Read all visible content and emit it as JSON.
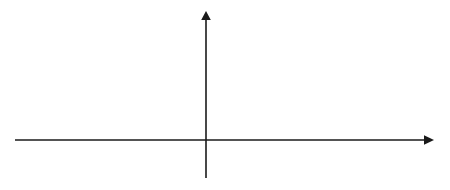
{
  "figure": {
    "background_color": "#ffffff",
    "line_color": "#3a3a3a",
    "axis_color": "#1a1a1a",
    "dash_color": "#111111"
  },
  "axes": {
    "y_axis_label": "a(τ)",
    "x_axis_label": "τ",
    "origin_px": {
      "x": 206,
      "y": 140
    },
    "x_axis_start_px": 15,
    "x_axis_end_px": 432,
    "y_axis_top_px": 12,
    "y_axis_bottom_px": 178
  },
  "ticks": [
    {
      "label": "T",
      "x_px": 264,
      "value": 1
    },
    {
      "label": "2T",
      "x_px": 322,
      "value": 2
    }
  ],
  "dimensions": [
    {
      "name": "epsilon-dimension",
      "label": "ε",
      "from_px": 206,
      "to_px": 227,
      "y_px": 68,
      "arrow_style": "outward"
    },
    {
      "name": "period-dimension",
      "label": "T",
      "from_px": 264,
      "to_px": 322,
      "y_px": 68,
      "arrow_style": "inward"
    }
  ],
  "dashed_verticals": [
    {
      "name": "epsilon-marker",
      "x_px": 227,
      "top_px": 50,
      "bottom_px": 141
    },
    {
      "name": "tick-marker-T",
      "x_px": 264,
      "top_px": 50,
      "bottom_px": 141
    },
    {
      "name": "tick-marker-2T",
      "x_px": 322,
      "top_px": 50,
      "bottom_px": 141
    }
  ],
  "chart_data": {
    "type": "line",
    "xlabel": "τ",
    "ylabel": "a(τ)",
    "period_T_px": 57.5,
    "peak_height_px": 40,
    "base_half_width_px": 16.5,
    "baseline_y_px": 140,
    "peak_y_px": 100,
    "xlim": [
      15,
      432
    ],
    "ylim": [
      0,
      1
    ],
    "grid": false,
    "legend": null,
    "series": [
      {
        "name": "a(τ)",
        "peaks_px": [
          33,
          90.5,
          148,
          206,
          263.5,
          321,
          378.5
        ],
        "peaks_tau": [
          -3,
          -2,
          -1,
          0,
          1,
          2,
          3
        ],
        "values": [
          1,
          1,
          1,
          1,
          1,
          1,
          1
        ]
      }
    ]
  }
}
